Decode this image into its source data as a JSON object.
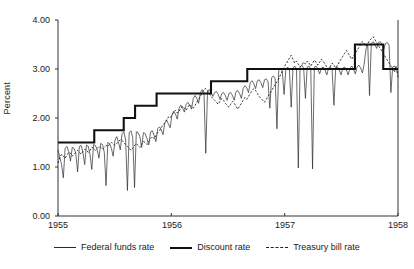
{
  "chart_data": {
    "type": "line",
    "title": "",
    "xlabel": "",
    "ylabel": "Percent",
    "xlim": [
      1955.0,
      1958.0
    ],
    "ylim": [
      0.0,
      4.0
    ],
    "grid": false,
    "legend_position": "bottom",
    "y_ticks": [
      "0.00",
      "1.00",
      "2.00",
      "3.00",
      "4.00"
    ],
    "y_tick_values": [
      0,
      1,
      2,
      3,
      4
    ],
    "x_ticks": [
      "1955",
      "1956",
      "1957",
      "1958"
    ],
    "x_tick_values": [
      1955,
      1956,
      1957,
      1958
    ],
    "series": [
      {
        "name": "Discount rate",
        "style": "thick-solid",
        "color": "#111111",
        "type": "step",
        "steps": [
          {
            "x": 1955.0,
            "y": 1.5
          },
          {
            "x": 1955.32,
            "y": 1.75
          },
          {
            "x": 1955.58,
            "y": 2.0
          },
          {
            "x": 1955.68,
            "y": 2.25
          },
          {
            "x": 1955.87,
            "y": 2.5
          },
          {
            "x": 1956.35,
            "y": 2.75
          },
          {
            "x": 1956.67,
            "y": 3.0
          },
          {
            "x": 1957.62,
            "y": 3.5
          },
          {
            "x": 1957.87,
            "y": 3.0
          },
          {
            "x": 1958.0,
            "y": 3.0
          }
        ]
      },
      {
        "name": "Federal funds rate",
        "style": "thin-solid",
        "color": "#2a2a2a",
        "type": "line-volatile",
        "values": [
          1.35,
          1.2,
          1.05,
          0.78,
          1.38,
          1.42,
          1.32,
          1.12,
          1.4,
          1.38,
          1.28,
          0.9,
          1.42,
          1.44,
          1.3,
          1.05,
          1.45,
          1.42,
          1.25,
          0.95,
          1.46,
          1.44,
          1.35,
          1.18,
          1.48,
          1.46,
          1.3,
          0.62,
          1.5,
          1.48,
          1.38,
          1.22,
          1.55,
          1.62,
          1.5,
          1.35,
          1.68,
          1.72,
          1.55,
          0.52,
          1.7,
          1.74,
          1.6,
          0.58,
          1.72,
          1.7,
          1.62,
          1.4,
          1.7,
          1.68,
          1.58,
          1.45,
          1.72,
          1.74,
          1.65,
          1.52,
          1.78,
          1.82,
          1.76,
          1.66,
          1.9,
          1.96,
          1.88,
          1.8,
          2.06,
          2.14,
          2.08,
          1.98,
          2.2,
          2.26,
          2.2,
          2.12,
          2.28,
          2.32,
          2.26,
          2.18,
          2.4,
          2.46,
          2.4,
          2.3,
          2.52,
          2.58,
          2.52,
          1.28,
          2.55,
          2.58,
          2.52,
          2.44,
          2.52,
          2.54,
          2.48,
          2.38,
          2.5,
          2.52,
          2.46,
          2.36,
          2.5,
          2.52,
          2.46,
          2.36,
          2.54,
          2.56,
          2.5,
          2.4,
          2.6,
          2.66,
          2.62,
          2.52,
          2.72,
          2.76,
          2.7,
          2.6,
          2.76,
          2.78,
          2.72,
          2.62,
          2.78,
          2.8,
          2.74,
          2.2,
          2.82,
          2.86,
          2.8,
          1.78,
          2.96,
          3.02,
          2.96,
          2.48,
          3.0,
          3.04,
          2.98,
          2.22,
          3.02,
          3.06,
          3.0,
          0.98,
          3.04,
          3.08,
          3.02,
          2.4,
          3.04,
          3.06,
          3.0,
          0.96,
          3.04,
          3.06,
          3.0,
          2.9,
          3.02,
          3.04,
          2.98,
          2.88,
          3.02,
          3.04,
          2.98,
          2.26,
          3.02,
          3.04,
          2.98,
          2.88,
          3.02,
          3.04,
          2.98,
          2.88,
          3.02,
          3.06,
          3.0,
          2.9,
          3.04,
          3.08,
          3.02,
          2.92,
          3.1,
          3.4,
          3.5,
          2.46,
          3.52,
          3.56,
          3.5,
          3.42,
          3.54,
          3.56,
          3.5,
          3.4,
          3.52,
          3.54,
          3.48,
          2.52,
          3.04,
          3.06,
          3.0,
          2.9
        ]
      },
      {
        "name": "Treasury bill rate",
        "style": "dashed",
        "color": "#222222",
        "type": "line",
        "values": [
          1.08,
          1.2,
          1.26,
          1.22,
          1.18,
          1.24,
          1.3,
          1.28,
          1.22,
          1.26,
          1.3,
          1.34,
          1.3,
          1.26,
          1.32,
          1.36,
          1.34,
          1.3,
          1.34,
          1.4,
          1.38,
          1.34,
          1.38,
          1.42,
          1.4,
          1.36,
          1.4,
          1.44,
          1.42,
          1.46,
          1.5,
          1.48,
          1.44,
          1.48,
          1.52,
          1.56,
          1.54,
          1.5,
          1.46,
          1.42,
          1.38,
          1.34,
          1.38,
          1.44,
          1.48,
          1.44,
          1.4,
          1.46,
          1.52,
          1.5,
          1.46,
          1.52,
          1.58,
          1.62,
          1.58,
          1.64,
          1.7,
          1.74,
          1.8,
          1.86,
          1.9,
          1.96,
          2.02,
          2.0,
          2.06,
          2.12,
          2.16,
          2.1,
          2.14,
          2.2,
          2.24,
          2.2,
          2.16,
          2.22,
          2.28,
          2.24,
          2.2,
          2.26,
          2.32,
          2.38,
          2.44,
          2.52,
          2.58,
          2.6,
          2.56,
          2.5,
          2.44,
          2.4,
          2.36,
          2.32,
          2.28,
          2.34,
          2.4,
          2.36,
          2.3,
          2.26,
          2.22,
          2.28,
          2.34,
          2.3,
          2.24,
          2.18,
          2.24,
          2.3,
          2.36,
          2.42,
          2.38,
          2.44,
          2.5,
          2.56,
          2.6,
          2.56,
          2.5,
          2.44,
          2.4,
          2.36,
          2.32,
          2.38,
          2.44,
          2.5,
          2.56,
          2.62,
          2.68,
          2.74,
          2.8,
          2.88,
          2.96,
          3.04,
          3.1,
          3.16,
          3.22,
          3.28,
          3.2,
          3.12,
          3.16,
          3.1,
          3.04,
          3.08,
          3.14,
          3.1,
          3.16,
          3.12,
          3.06,
          3.12,
          3.18,
          3.14,
          3.08,
          3.14,
          3.2,
          3.16,
          3.1,
          3.04,
          3.0,
          3.06,
          3.12,
          3.08,
          3.02,
          3.08,
          3.14,
          3.2,
          3.26,
          3.32,
          3.38,
          3.32,
          3.26,
          3.2,
          3.26,
          3.32,
          3.38,
          3.44,
          3.5,
          3.56,
          3.52,
          3.46,
          3.52,
          3.58,
          3.62,
          3.66,
          3.6,
          3.54,
          3.48,
          3.42,
          3.36,
          3.3,
          3.24,
          3.18,
          3.12,
          3.06,
          3.0,
          2.94,
          3.06,
          2.82
        ]
      }
    ]
  },
  "legend": {
    "items": [
      {
        "label": "Federal funds rate",
        "style": "thin"
      },
      {
        "label": "Discount rate",
        "style": "thick"
      },
      {
        "label": "Treasury bill rate",
        "style": "dash"
      }
    ]
  }
}
